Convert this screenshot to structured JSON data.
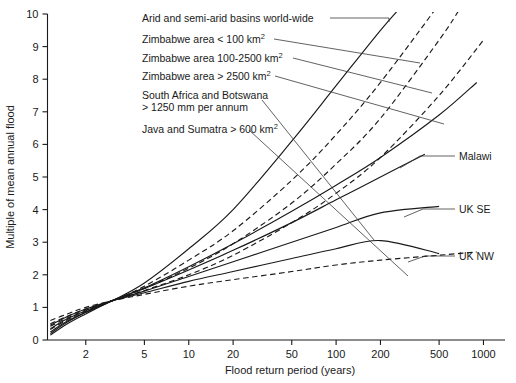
{
  "chart_data": {
    "type": "line",
    "title": "",
    "xlabel": "Flood return period (years)",
    "ylabel": "Multiple of mean annual flood",
    "x_scale": "log",
    "xlim": [
      1.1,
      1400
    ],
    "ylim": [
      0,
      10
    ],
    "xticks": [
      2,
      5,
      10,
      20,
      50,
      100,
      200,
      500,
      1000
    ],
    "xtick_labels": [
      "2",
      "5",
      "10",
      "20",
      "50",
      "100",
      "200",
      "500",
      "1000"
    ],
    "yticks": [
      0,
      1,
      2,
      3,
      4,
      5,
      6,
      7,
      8,
      9,
      10
    ],
    "ytick_labels": [
      "0",
      "1",
      "2",
      "3",
      "4",
      "5",
      "6",
      "7",
      "8",
      "9",
      "10"
    ],
    "grid": false,
    "legend_position": "inline-annotations",
    "series": [
      {
        "name": "Arid and semi-arid basins world-wide",
        "style": "solid",
        "x": [
          1.15,
          1.5,
          2,
          3,
          5,
          10,
          20,
          50,
          100,
          200,
          300
        ],
        "values": [
          0.2,
          0.55,
          0.85,
          1.2,
          1.75,
          2.8,
          4.0,
          6.1,
          7.8,
          9.5,
          10.4
        ]
      },
      {
        "name": "Zimbabwe area < 100 km2",
        "style": "dashed",
        "x": [
          1.15,
          1.5,
          2,
          3,
          5,
          10,
          20,
          50,
          100,
          200,
          500
        ],
        "values": [
          0.32,
          0.62,
          0.88,
          1.2,
          1.65,
          2.45,
          3.35,
          4.9,
          6.3,
          7.9,
          10.3
        ]
      },
      {
        "name": "Zimbabwe area 100-2500 km2",
        "style": "dashed",
        "x": [
          1.15,
          1.5,
          2,
          3,
          5,
          10,
          20,
          50,
          100,
          200,
          500,
          700
        ],
        "values": [
          0.42,
          0.68,
          0.92,
          1.2,
          1.58,
          2.2,
          2.95,
          4.2,
          5.4,
          6.8,
          9.2,
          10.2
        ]
      },
      {
        "name": "Zimbabwe area > 2500 km2",
        "style": "dashed",
        "x": [
          1.15,
          1.5,
          2,
          3,
          5,
          10,
          20,
          50,
          100,
          200,
          500,
          1000
        ],
        "values": [
          0.5,
          0.73,
          0.95,
          1.2,
          1.52,
          2.0,
          2.6,
          3.6,
          4.5,
          5.6,
          7.5,
          9.2
        ]
      },
      {
        "name": "South Africa and Botswana > 1250 mm per annum",
        "style": "solid",
        "x": [
          1.15,
          1.5,
          2,
          3,
          5,
          10,
          20,
          50,
          100,
          200,
          500,
          900
        ],
        "values": [
          0.15,
          0.5,
          0.8,
          1.2,
          1.6,
          2.25,
          2.95,
          3.95,
          4.75,
          5.6,
          6.9,
          7.9
        ]
      },
      {
        "name": "Malawi",
        "style": "solid",
        "x": [
          1.15,
          1.5,
          2,
          3,
          5,
          10,
          20,
          50,
          100,
          200,
          400
        ],
        "values": [
          0.25,
          0.58,
          0.85,
          1.2,
          1.58,
          2.15,
          2.75,
          3.6,
          4.3,
          5.0,
          5.7
        ]
      },
      {
        "name": "UK SE",
        "style": "solid",
        "x": [
          1.15,
          1.5,
          2,
          3,
          5,
          10,
          20,
          50,
          100,
          200,
          500
        ],
        "values": [
          0.35,
          0.65,
          0.9,
          1.2,
          1.5,
          1.95,
          2.4,
          3.0,
          3.45,
          3.9,
          4.1
        ]
      },
      {
        "name": "UK NW",
        "style": "solid",
        "x": [
          1.15,
          1.5,
          2,
          3,
          5,
          10,
          20,
          50,
          100,
          200,
          500
        ],
        "values": [
          0.45,
          0.72,
          0.95,
          1.2,
          1.45,
          1.8,
          2.1,
          2.5,
          2.8,
          3.05,
          2.65
        ]
      },
      {
        "name": "Java and Sumatra > 600 km2",
        "style": "dashed",
        "x": [
          1.15,
          1.5,
          2,
          3,
          5,
          10,
          20,
          50,
          100,
          200,
          500,
          900
        ],
        "values": [
          0.6,
          0.8,
          1.0,
          1.2,
          1.4,
          1.65,
          1.85,
          2.1,
          2.3,
          2.45,
          2.6,
          2.7
        ]
      }
    ]
  },
  "annotations": {
    "left_labels": [
      {
        "id": "arid",
        "text": "Arid and semi-arid basins world-wide"
      },
      {
        "id": "zim-small",
        "text_main": "Zimbabwe area < 100 km",
        "sup": "2"
      },
      {
        "id": "zim-mid",
        "text_main": "Zimbabwe area 100-2500 km",
        "sup": "2"
      },
      {
        "id": "zim-large",
        "text_main": "Zimbabwe area > 2500 km",
        "sup": "2"
      },
      {
        "id": "south-africa-line1",
        "text": "South Africa and Botswana"
      },
      {
        "id": "south-africa-line2",
        "text": "> 1250 mm per annum"
      },
      {
        "id": "java",
        "text_main": "Java and Sumatra > 600 km",
        "sup": "2"
      }
    ],
    "right_labels": [
      {
        "id": "malawi",
        "text": "Malawi"
      },
      {
        "id": "uk-se",
        "text": "UK SE"
      },
      {
        "id": "uk-nw",
        "text": "UK NW"
      }
    ]
  },
  "axes": {
    "y_title": "Multiple of mean annual flood",
    "x_title": "Flood return period (years)"
  },
  "colors": {
    "ink": "#1a1a1a",
    "background": "#ffffff",
    "leader": "#3a3a3a"
  }
}
